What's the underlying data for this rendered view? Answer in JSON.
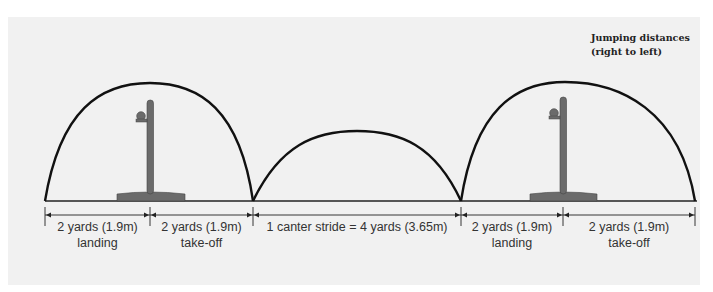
{
  "title": {
    "line1": "Jumping distances",
    "line2": "(right to left)"
  },
  "colors": {
    "panel": "#f1f1f1",
    "arc": "#111111",
    "post": "#6b6b6b",
    "text": "#333333"
  },
  "segments": [
    {
      "distance": "2 yards (1.9m)",
      "phase": "landing"
    },
    {
      "distance": "2 yards (1.9m)",
      "phase": "take-off"
    },
    {
      "distance": "1 canter stride = 4 yards (3.65m)",
      "phase": ""
    },
    {
      "distance": "2 yards (1.9m)",
      "phase": "landing"
    },
    {
      "distance": "2 yards (1.9m)",
      "phase": "take-off"
    }
  ],
  "elements": {
    "jumps": [
      "fence-post-1",
      "fence-post-2"
    ],
    "arcs": [
      "jump-arc-1",
      "canter-stride-arc",
      "jump-arc-2"
    ]
  }
}
